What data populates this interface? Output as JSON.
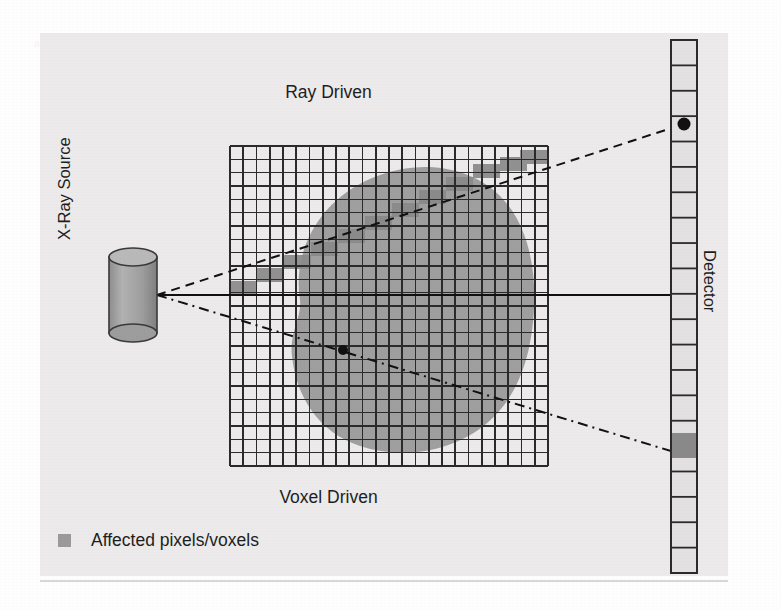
{
  "figure": {
    "background_color": "#fefefe",
    "panel_color": "#eceaea",
    "ink_color": "#1e1e1e",
    "organ_fill": "#9b9b9b",
    "affected_fill": "#8a8a8a",
    "labels": {
      "top": "Ray Driven",
      "bottom": "Voxel Driven",
      "left": "X-Ray Source",
      "right": "Detector"
    },
    "legend": {
      "swatch_color": "#9a9a9a",
      "text": "Affected pixels/voxels"
    },
    "ghost_text": "a line of faded show-through text from the reverse side of the printed page"
  },
  "diagram_data": {
    "type": "diagram",
    "title": "Ray Driven vs Voxel Driven projection",
    "grid": {
      "x": 230,
      "y": 146,
      "width": 318,
      "height": 320,
      "columns": 24,
      "rows": 24,
      "cell_size": 13.25,
      "line_color": "#2b2b2b"
    },
    "source": {
      "label": "X-Ray Source",
      "shape": "cylinder",
      "cx": 133,
      "cy": 295,
      "rx": 24,
      "ry": 9,
      "body_height": 76,
      "apex_x": 157,
      "apex_y": 295
    },
    "detector": {
      "label": "Detector",
      "x": 671,
      "y": 40,
      "width": 26,
      "height": 533,
      "cells": 21,
      "hit_cell_index": 17,
      "hit_cell_color": "#8a8a8a",
      "marker_dot": {
        "x": 684,
        "y": 124,
        "r": 6
      }
    },
    "rays": [
      {
        "name": "ray-driven",
        "style": "dashed",
        "from": [
          157,
          295
        ],
        "to": [
          684,
          124
        ]
      },
      {
        "name": "central-ray",
        "style": "solid",
        "from": [
          157,
          295
        ],
        "to": [
          671,
          295
        ]
      },
      {
        "name": "voxel-driven",
        "style": "dash-dot",
        "from": [
          157,
          295
        ],
        "to": [
          684,
          455
        ]
      }
    ],
    "voxel_center_dot": {
      "x": 343,
      "y": 350,
      "r": 5
    },
    "affected_voxels_note": "Shaded staircase of grid cells traversed by the ray-driven line"
  }
}
